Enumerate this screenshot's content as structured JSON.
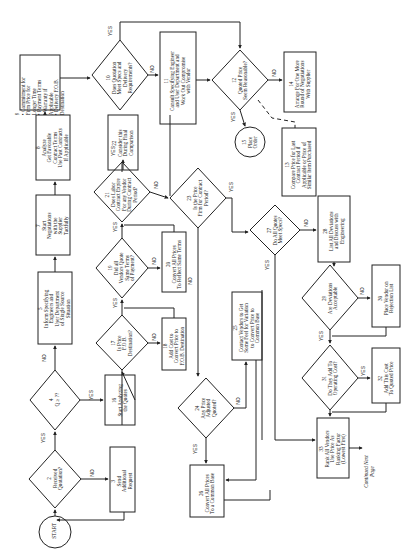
{
  "figure": {
    "orientation": "rotated-90-ccw",
    "caption": "Figure — Vendor quote analysis flowchart (continued)",
    "continuation": "Continued Next Page"
  },
  "nodes": [
    {
      "id": "start",
      "type": "terminal",
      "label": "START"
    },
    {
      "id": "2",
      "type": "decision",
      "label": "2\nReceived\nQuotation?"
    },
    {
      "id": "3",
      "type": "process",
      "label": "3\nSend\nAdditional\nRequest"
    },
    {
      "id": "4",
      "type": "decision",
      "label": "4\nQ ≥ ??"
    },
    {
      "id": "5",
      "type": "process",
      "label": "5\nInform Specifying\nEngineers and\nUser Department\nof Single Source\nSituation"
    },
    {
      "id": "7",
      "type": "process",
      "label": "7\nStart\nNegotiations\nwith the\nSupplier\nTactfully"
    },
    {
      "id": "8",
      "type": "process",
      "label": "8\nAnalyze\nGet Favorable\nContract Terms\nUse Past Contracts\nIf Applicable"
    },
    {
      "id": "9",
      "type": "process",
      "label": "9\n• Commitment for\n  Firm Price for\n  Longer Time\n• Payment Terms\n• Warranty if\n  Applicable\n• Delivery F.O.B.\n  Destination"
    },
    {
      "id": "10",
      "type": "decision",
      "label": "10\nDoes Quotation\nMeet Specs and\nDelivery\nRequirements?"
    },
    {
      "id": "11",
      "type": "process",
      "label": "11\nConsult Specifying Engineer\nand User Department and\nWork Out Compromise\nwith Vendor"
    },
    {
      "id": "12",
      "type": "decision",
      "label": "12\nQuoted Price\nSeem Reasonable?"
    },
    {
      "id": "13",
      "type": "process",
      "label": "13\nCompare Price for Last\nContract Period if\nApplicable or Price of\nSimilar Item Purchased"
    },
    {
      "id": "14",
      "type": "process",
      "label": "14\nArrange For One More\nRound of Negotiations\nWith Supplier"
    },
    {
      "id": "15",
      "type": "terminal",
      "label": "15\nPlace\nOrder"
    },
    {
      "id": "16",
      "type": "process",
      "label": "16\nStart Analyzing\nthe Quotes"
    },
    {
      "id": "17",
      "type": "decision",
      "label": "17\nIs Price\nF.O.B.\nDestination?"
    },
    {
      "id": "18",
      "type": "process",
      "label": "18\nAdd Cost to\nConvert Price to\nF.O.B. Destination"
    },
    {
      "id": "19",
      "type": "decision",
      "label": "19\nDid all\nVendors Quote\nSame Terms\nof Payment?"
    },
    {
      "id": "20",
      "type": "process",
      "label": "20\nConvert All Prices\nTo Reflect Same Terms"
    },
    {
      "id": "21",
      "type": "decision",
      "label": "21\nDoes Labor\nContract Expire\nFor any Vendor\nDuring Contract\nPeriod?"
    },
    {
      "id": "22",
      "type": "process",
      "label": "22\nConsider this\nDuring Final\nComparison"
    },
    {
      "id": "23",
      "type": "decision",
      "label": "23\nIs the Price\nFirm for Contract\nPeriod?"
    },
    {
      "id": "24",
      "type": "decision",
      "label": "24\nAny Price\nAdjusted\nQuoted?"
    },
    {
      "id": "25",
      "type": "process",
      "label": "25\nContact Vendors to Get\nSome Feel for Variation\nto Convert Price to\nCommon Base"
    },
    {
      "id": "26",
      "type": "process",
      "label": "26\nConvert All Prices\nTo a Common Base"
    },
    {
      "id": "27",
      "type": "decision",
      "label": "27\nDo All Quotes\nMeet Specs?"
    },
    {
      "id": "28",
      "type": "process",
      "label": "28\nList All Deviations\nand Discuss with\nEngineering"
    },
    {
      "id": "29",
      "type": "decision",
      "label": "29\nAre Deviations\nAcceptable"
    },
    {
      "id": "30",
      "type": "process",
      "label": "30\nPlace Vendor on\nRejection List"
    },
    {
      "id": "31",
      "type": "decision",
      "label": "31\nDo They Add To\nOperating Cost?"
    },
    {
      "id": "32",
      "type": "process",
      "label": "32\nAdd This Cost\nTo Quoted Price"
    },
    {
      "id": "33",
      "type": "process",
      "label": "33\nRank All Vendors\nUse Price As\nRanking Factor\n(Lowest First)"
    }
  ],
  "edge_labels": {
    "yes": "YES",
    "no": "NO"
  },
  "colors": {
    "ink": "#222222",
    "paper": "#ffffff",
    "caption": "#777777"
  }
}
